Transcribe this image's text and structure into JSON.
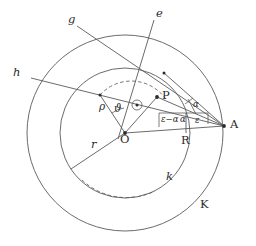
{
  "figure": {
    "type": "geometric-diagram",
    "background_color": "#ffffff",
    "stroke_color": "#5a5a5a",
    "label_color": "#2b2b2b"
  },
  "points": {
    "center": {
      "label": "O",
      "x": 125,
      "y": 133
    },
    "point_p": {
      "label": "P",
      "x": 157,
      "y": 97
    },
    "point_a": {
      "label": "A",
      "x": 224,
      "y": 126
    },
    "point_r": {
      "label": "R",
      "x": 186,
      "y": 133
    },
    "rho_end": {
      "label": "",
      "x": 100,
      "y": 95
    },
    "g_on_circle": {
      "label": "",
      "x": 164,
      "y": 73
    }
  },
  "labels": {
    "center": "O",
    "point_p": "P",
    "point_a": "A",
    "foot_r": "R",
    "inner_circle": "k",
    "outer_circle": "K",
    "radius_r": "r",
    "radius_rho": "ρ",
    "angle_theta": "ϑ",
    "ray_e": "e",
    "ray_g": "g",
    "ray_h": "h",
    "angle_alpha_upper": "α",
    "angle_alpha_lower": "α",
    "angle_epsilon": "ε",
    "angle_epsilon_minus_alpha": "ε−α"
  },
  "label_positions": {
    "center": {
      "x": 120,
      "y": 140
    },
    "point_p": {
      "x": 162,
      "y": 91
    },
    "point_a": {
      "x": 230,
      "y": 120
    },
    "foot_r": {
      "x": 181,
      "y": 138
    },
    "inner_circle": {
      "x": 166,
      "y": 176
    },
    "outer_circle": {
      "x": 200,
      "y": 204
    },
    "radius_r": {
      "x": 91,
      "y": 142
    },
    "radius_rho": {
      "x": 101,
      "y": 107
    },
    "angle_theta": {
      "x": 115,
      "y": 108
    },
    "ray_e": {
      "x": 157,
      "y": 11
    },
    "ray_g": {
      "x": 68,
      "y": 17
    },
    "ray_h": {
      "x": 13,
      "y": 70
    },
    "angle_alpha_upper": {
      "x": 194,
      "y": 106
    },
    "angle_alpha_lower": {
      "x": 181,
      "y": 121
    },
    "angle_epsilon": {
      "x": 207,
      "y": 120
    },
    "angle_eps_minus_alpha": {
      "x": 161,
      "y": 118
    }
  },
  "circles": {
    "outer": {
      "name": "K",
      "cx": 125,
      "cy": 133,
      "r": 98
    },
    "inner": {
      "name": "k",
      "cx": 125,
      "cy": 133,
      "r": 65
    }
  },
  "geometry_values": {
    "outer_radius_px": 98,
    "inner_radius_px": 65,
    "center_x_px": 125,
    "center_y_px": 133
  }
}
